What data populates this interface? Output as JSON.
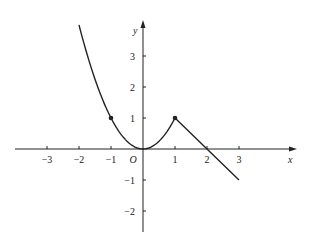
{
  "chart_data": {
    "type": "line",
    "title": "",
    "xlabel": "x",
    "ylabel": "y",
    "origin_label": "O",
    "xlim": [
      -3.5,
      4.5
    ],
    "ylim": [
      -2.6,
      4.1
    ],
    "grid": false,
    "x_ticks": [
      -3,
      -2,
      -1,
      1,
      2,
      3
    ],
    "x_tick_labels": [
      "−3",
      "−2",
      "−1",
      "1",
      "2",
      "3"
    ],
    "y_ticks": [
      3,
      2,
      1,
      -1,
      -2
    ],
    "y_tick_labels": [
      "3",
      "2",
      "1",
      "−1",
      "−2"
    ],
    "series": [
      {
        "name": "y = x^2 (x ≤ 1)",
        "kind": "curve",
        "x": [
          -2,
          -1.5,
          -1,
          -0.5,
          0,
          0.5,
          1
        ],
        "y": [
          4,
          2.25,
          1,
          0.25,
          0,
          0.25,
          1
        ]
      },
      {
        "name": "y = -x + 2 (x ≥ 1)",
        "kind": "line",
        "x": [
          1,
          2,
          3
        ],
        "y": [
          1,
          0,
          -1
        ]
      }
    ],
    "marked_points": [
      {
        "x": -1,
        "y": 1
      },
      {
        "x": 1,
        "y": 1
      }
    ],
    "color": "#222222"
  }
}
